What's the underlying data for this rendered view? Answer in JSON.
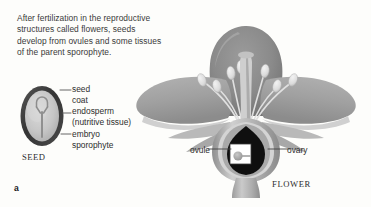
{
  "figure": {
    "panel_letter": "a",
    "caption": "After fertilization in the reproductive\nstructures called flowers, seeds\ndevelop from ovules and some tissues\nof the parent sporophyte."
  },
  "seed_diagram": {
    "title": "SEED",
    "labels": {
      "seed_coat": "seed\ncoat",
      "endosperm": "endosperm\n(nutritive tissue)",
      "embryo": "embryo\nsporophyte"
    }
  },
  "flower_diagram": {
    "title": "FLOWER",
    "labels": {
      "ovule": "ovule",
      "ovary": "ovary"
    }
  },
  "colors": {
    "background": "#fdfdfb",
    "text": "#2e2e2e",
    "seed_coat": "#3f3f3f",
    "endosperm": "#c3c3c3",
    "embryo": "#9a9a9a",
    "petal_back": "#8e8e8e",
    "petal_side": "#a5a5a5",
    "petal_highlight": "#d2d2d2",
    "sepal": "#bdbdbd",
    "stem": "#b5b5b5",
    "ovary_cavity": "#101010",
    "ovule_box": "#ffffff",
    "anther": "#e4e4e4",
    "filament": "#d8d8d8",
    "leader_line": "#555555"
  }
}
